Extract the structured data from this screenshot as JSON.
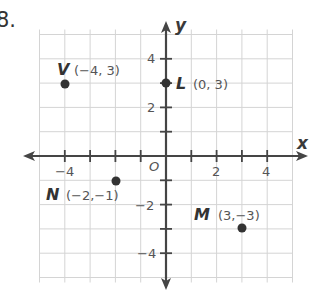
{
  "problem": {
    "number": "8."
  },
  "colors": {
    "grid": "#d4d4d4",
    "axis": "#454545",
    "point": "#333333",
    "text": "#444444",
    "label_text": "#555555"
  },
  "axes": {
    "x_label": "x",
    "y_label": "y",
    "origin_label": "O",
    "x_tick_labels": [
      {
        "value": -4,
        "text": "−4"
      },
      {
        "value": 2,
        "text": "2"
      },
      {
        "value": 4,
        "text": "4"
      }
    ],
    "y_tick_labels": [
      {
        "value": 4,
        "text": "4"
      },
      {
        "value": 2,
        "text": "2"
      },
      {
        "value": -2,
        "text": "−2"
      },
      {
        "value": -4,
        "text": "−4"
      }
    ],
    "x_range": [
      -5,
      5
    ],
    "y_range": [
      -5,
      5
    ]
  },
  "points": [
    {
      "name": "V",
      "coords": "(−4, 3)",
      "x": -4,
      "y": 3
    },
    {
      "name": "L",
      "coords": "(0, 3)",
      "x": 0,
      "y": 3
    },
    {
      "name": "N",
      "coords": "(−2,−1)",
      "x": -2,
      "y": -1
    },
    {
      "name": "M",
      "coords": "(3,−3)",
      "x": 3,
      "y": -3
    }
  ]
}
